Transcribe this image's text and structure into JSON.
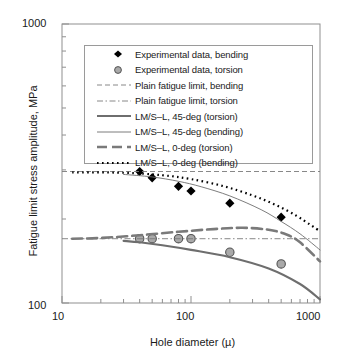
{
  "chart_data": {
    "type": "line",
    "title": "",
    "xlabel": "Hole diameter (µ)",
    "ylabel": "Fatigue limit stress amplitude, MPa",
    "xscale": "log",
    "yscale": "log",
    "xlim": [
      10,
      1000
    ],
    "ylim": [
      100,
      1000
    ],
    "xticks": [
      "10",
      "100",
      "1000"
    ],
    "yticks": [
      "100",
      "1000"
    ],
    "grid": false,
    "legend_position": "upper-center",
    "series": [
      {
        "name": "Experimental data, bending",
        "style": "marker",
        "marker": "filled-diamond",
        "color": "#000000",
        "points": [
          {
            "x": 40,
            "y": 296
          },
          {
            "x": 50,
            "y": 281
          },
          {
            "x": 80,
            "y": 262
          },
          {
            "x": 100,
            "y": 252
          },
          {
            "x": 200,
            "y": 228
          },
          {
            "x": 500,
            "y": 203
          }
        ]
      },
      {
        "name": "Experimental data, torsion",
        "style": "marker",
        "marker": "filled-circle",
        "color": "#8c8c8c",
        "points": [
          {
            "x": 40,
            "y": 170
          },
          {
            "x": 50,
            "y": 170
          },
          {
            "x": 80,
            "y": 170
          },
          {
            "x": 100,
            "y": 170
          },
          {
            "x": 200,
            "y": 152
          },
          {
            "x": 500,
            "y": 138
          }
        ]
      },
      {
        "name": "Plain fatigue limit, bending",
        "style": "dashed",
        "color": "#7a7a7a",
        "constant_y": 296
      },
      {
        "name": "Plain fatigue limit, torsion",
        "style": "dash-dot",
        "color": "#7a7a7a",
        "constant_y": 170
      },
      {
        "name": "LM/S–L, 45-deg (torsion)",
        "style": "solid-thick",
        "color": "#6e6e6e",
        "points": [
          {
            "x": 30,
            "y": 167
          },
          {
            "x": 40,
            "y": 165
          },
          {
            "x": 60,
            "y": 161
          },
          {
            "x": 100,
            "y": 155
          },
          {
            "x": 200,
            "y": 146
          },
          {
            "x": 400,
            "y": 133
          },
          {
            "x": 700,
            "y": 117
          },
          {
            "x": 1000,
            "y": 103
          }
        ]
      },
      {
        "name": "LM/S–L, 45-deg (bending)",
        "style": "solid-thin",
        "color": "#6e6e6e",
        "points": [
          {
            "x": 30,
            "y": 289
          },
          {
            "x": 50,
            "y": 283
          },
          {
            "x": 80,
            "y": 273
          },
          {
            "x": 120,
            "y": 261
          },
          {
            "x": 200,
            "y": 242
          },
          {
            "x": 350,
            "y": 216
          },
          {
            "x": 500,
            "y": 196
          },
          {
            "x": 700,
            "y": 177
          },
          {
            "x": 1000,
            "y": 155
          }
        ]
      },
      {
        "name": "LM/S–L, 0-deg (torsion)",
        "style": "dashed-thick",
        "color": "#7a7a7a",
        "points": [
          {
            "x": 12,
            "y": 170
          },
          {
            "x": 20,
            "y": 171
          },
          {
            "x": 40,
            "y": 175
          },
          {
            "x": 80,
            "y": 180
          },
          {
            "x": 150,
            "y": 184
          },
          {
            "x": 250,
            "y": 186
          },
          {
            "x": 400,
            "y": 183
          },
          {
            "x": 550,
            "y": 176
          },
          {
            "x": 700,
            "y": 165
          },
          {
            "x": 1000,
            "y": 141
          }
        ]
      },
      {
        "name": "LM/S–L, 0-deg (bending)",
        "style": "dotted",
        "color": "#000000",
        "points": [
          {
            "x": 12,
            "y": 294
          },
          {
            "x": 30,
            "y": 293
          },
          {
            "x": 60,
            "y": 287
          },
          {
            "x": 100,
            "y": 278
          },
          {
            "x": 180,
            "y": 262
          },
          {
            "x": 300,
            "y": 243
          },
          {
            "x": 450,
            "y": 225
          },
          {
            "x": 650,
            "y": 206
          },
          {
            "x": 850,
            "y": 190
          },
          {
            "x": 1000,
            "y": 181
          }
        ]
      }
    ]
  },
  "legend": {
    "items": [
      {
        "label": "Experimental data, bending",
        "key": "marker-diamond"
      },
      {
        "label": "Experimental data, torsion",
        "key": "marker-circle"
      },
      {
        "label": "Plain fatigue limit, bending",
        "key": "line-dashed"
      },
      {
        "label": "Plain fatigue limit, torsion",
        "key": "line-dashdot"
      },
      {
        "label": "LM/S–L, 45-deg (torsion)",
        "key": "line-solid-thick"
      },
      {
        "label": "LM/S–L, 45-deg (bending)",
        "key": "line-solid-thin"
      },
      {
        "label": "LM/S–L, 0-deg (torsion)",
        "key": "line-dashed-thick"
      },
      {
        "label": "LM/S–L, 0-deg (bending)",
        "key": "line-dotted"
      }
    ]
  },
  "axes": {
    "y_top_label": "1000",
    "y_bottom_label": "100",
    "x_labels": [
      "10",
      "100",
      "1000"
    ],
    "x_title": "Hole diameter (µ)",
    "y_title": "Fatigue limit stress amplitude, MPa"
  },
  "colors": {
    "frame": "#8f8f8f",
    "gray_series": "#7a7a7a",
    "marker_gray": "#8c8c8c",
    "black": "#000000"
  }
}
